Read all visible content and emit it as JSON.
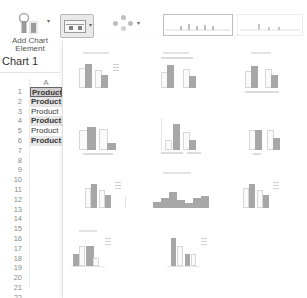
{
  "ribbon": {
    "add_chart_element": {
      "label_line1": "Add Chart",
      "label_line2": "Element",
      "icon": "add-chart-element-icon"
    },
    "quick_layout": {
      "icon": "quick-layout-icon",
      "caret": "▾",
      "active": true
    },
    "change_colors": {
      "icon": "change-colors-icon",
      "caret": "▾"
    },
    "chart_styles": {
      "icon": "chart-styles-strip",
      "count_visible": 2
    }
  },
  "sheet": {
    "name_box": "Chart 1",
    "column_header": "A",
    "rows": [
      {
        "n": "1",
        "value": "Product",
        "style": "selected"
      },
      {
        "n": "2",
        "value": "Product",
        "style": "bold"
      },
      {
        "n": "3",
        "value": "Product",
        "style": "normal"
      },
      {
        "n": "4",
        "value": "Product",
        "style": "bold"
      },
      {
        "n": "5",
        "value": "Product",
        "style": "normal"
      },
      {
        "n": "6",
        "value": "Product",
        "style": "bold"
      },
      {
        "n": "7",
        "value": "",
        "style": "normal"
      },
      {
        "n": "8",
        "value": "",
        "style": "normal"
      },
      {
        "n": "9",
        "value": "",
        "style": "normal"
      },
      {
        "n": "10",
        "value": "",
        "style": "normal"
      },
      {
        "n": "11",
        "value": "",
        "style": "normal"
      },
      {
        "n": "12",
        "value": "",
        "style": "normal"
      },
      {
        "n": "13",
        "value": "",
        "style": "normal"
      },
      {
        "n": "14",
        "value": "",
        "style": "normal"
      },
      {
        "n": "15",
        "value": "",
        "style": "normal"
      },
      {
        "n": "16",
        "value": "",
        "style": "normal"
      },
      {
        "n": "17",
        "value": "",
        "style": "normal"
      },
      {
        "n": "18",
        "value": "",
        "style": "normal"
      },
      {
        "n": "19",
        "value": "",
        "style": "normal"
      },
      {
        "n": "20",
        "value": "",
        "style": "normal"
      },
      {
        "n": "21",
        "value": "",
        "style": "normal"
      },
      {
        "n": "22",
        "value": "",
        "style": "normal"
      }
    ]
  },
  "gallery": {
    "title": "Quick Layout",
    "layouts": [
      {
        "id": "layout-1",
        "row": 0,
        "col": 0,
        "type": "clustered-legend-right"
      },
      {
        "id": "layout-2",
        "row": 0,
        "col": 1,
        "type": "clustered-legend-top"
      },
      {
        "id": "layout-3",
        "row": 0,
        "col": 2,
        "type": "clustered-legend-bottom"
      },
      {
        "id": "layout-4",
        "row": 1,
        "col": 0,
        "type": "clustered-data-labels"
      },
      {
        "id": "layout-5",
        "row": 1,
        "col": 1,
        "type": "clustered-data-table"
      },
      {
        "id": "layout-6",
        "row": 1,
        "col": 2,
        "type": "clustered-axis-titles"
      },
      {
        "id": "layout-7",
        "row": 2,
        "col": 0,
        "type": "clustered-gridlines-legend"
      },
      {
        "id": "layout-8",
        "row": 2,
        "col": 1,
        "type": "no-gap-columns"
      },
      {
        "id": "layout-9",
        "row": 2,
        "col": 2,
        "type": "clustered-axis-titles-legend"
      },
      {
        "id": "layout-10",
        "row": 3,
        "col": 0,
        "type": "clustered-stepped-legend"
      },
      {
        "id": "layout-11",
        "row": 3,
        "col": 1,
        "type": "clustered-thin-legend"
      }
    ]
  }
}
